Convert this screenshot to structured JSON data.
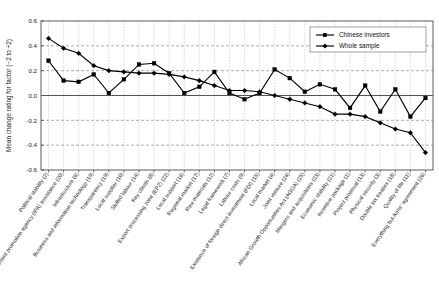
{
  "chart_data": {
    "type": "line",
    "title": "",
    "xlabel": "",
    "ylabel": "Mean change rating for factor (−2 to +2)",
    "ylim": [
      -0.6,
      0.6
    ],
    "yticks": [
      0.6,
      0.4,
      0.2,
      0.0,
      -0.2,
      -0.4,
      -0.6
    ],
    "ytick_labels": [
      "0.6",
      "0.4",
      "0.2",
      "0.0",
      "-0.2",
      "-0.4",
      "-0.6"
    ],
    "grid": true,
    "legend_position": "top-right",
    "categories": [
      "Political stability (2)",
      "Investment promotion agency (IPA) assistance (20)",
      "Infrastructure (6)",
      "Business and information technology (19)",
      "Transparency (19)",
      "Local supplier (10)",
      "Skilled labour (14)",
      "Key clients (8)",
      "Export processing zone (EPZ) (22)",
      "Local support (16)",
      "Regional market (17)",
      "Raw materials (12)",
      "Legal framework (7)",
      "Labour costs (9)",
      "Existence of foreign direct investment (FDI) (15)",
      "Local market (4)",
      "Joint venture (24)",
      "African Growth Opportunities Act (AGOA) (25)",
      "Mergers and acquisitions (23)",
      "Economic stability (21)",
      "Incentive package (1)",
      "Project proposal (13)",
      "Physical security (3)",
      "Double tax treaties (18)",
      "Quality of life (11)",
      "Everything but Arms' agreement (26)"
    ],
    "series": [
      {
        "name": "Chinese investors",
        "marker": "square",
        "color": "#000000",
        "values": [
          0.28,
          0.12,
          0.11,
          0.17,
          0.02,
          0.13,
          0.25,
          0.26,
          0.18,
          0.02,
          0.07,
          0.19,
          0.02,
          -0.03,
          0.02,
          0.21,
          0.14,
          0.03,
          0.09,
          0.05,
          -0.1,
          0.08,
          -0.13,
          0.05,
          -0.17,
          -0.02
        ]
      },
      {
        "name": "Whole sample",
        "marker": "diamond",
        "color": "#000000",
        "values": [
          0.46,
          0.38,
          0.34,
          0.24,
          0.2,
          0.19,
          0.18,
          0.18,
          0.17,
          0.15,
          0.12,
          0.08,
          0.04,
          0.04,
          0.03,
          0.0,
          -0.03,
          -0.06,
          -0.09,
          -0.15,
          -0.15,
          -0.17,
          -0.22,
          -0.27,
          -0.3,
          -0.46
        ]
      }
    ]
  },
  "legend": {
    "items": [
      {
        "label": "Chinese investors"
      },
      {
        "label": "Whole sample"
      }
    ]
  }
}
